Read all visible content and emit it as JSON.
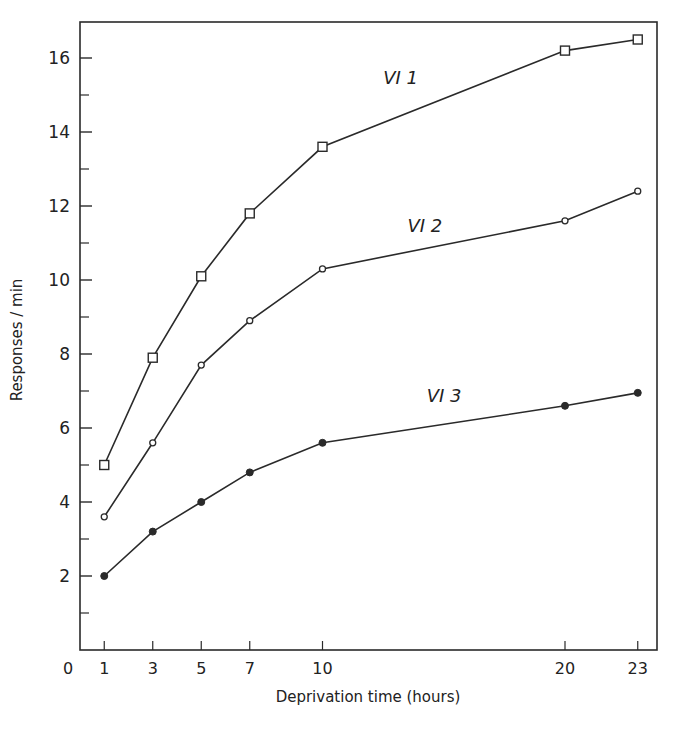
{
  "chart_data": {
    "type": "line",
    "title": "",
    "xlabel": "Deprivation time (hours)",
    "ylabel": "Responses / min",
    "x": [
      1,
      3,
      5,
      7,
      10,
      20,
      23
    ],
    "xticks": [
      0,
      1,
      3,
      5,
      7,
      10,
      20,
      23
    ],
    "yticks_labeled": [
      2,
      4,
      6,
      8,
      10,
      12,
      14,
      16
    ],
    "yticks_minor": [
      1,
      3,
      5,
      7,
      9,
      11,
      13,
      15
    ],
    "xlim": [
      0,
      24
    ],
    "ylim": [
      0,
      17
    ],
    "grid": false,
    "legend": "inline labels",
    "series": [
      {
        "name": "VI 1",
        "marker": "open-square",
        "values": [
          5.0,
          7.9,
          10.1,
          11.8,
          13.6,
          16.2,
          16.5
        ],
        "label_pos": [
          12.5,
          15.3
        ]
      },
      {
        "name": "VI 2",
        "marker": "open-circle",
        "values": [
          3.6,
          5.6,
          7.7,
          8.9,
          10.3,
          11.6,
          12.4
        ],
        "label_pos": [
          13.5,
          11.3
        ]
      },
      {
        "name": "VI 3",
        "marker": "filled-circle",
        "values": [
          2.0,
          3.2,
          4.0,
          4.8,
          5.6,
          6.6,
          6.95
        ],
        "label_pos": [
          14.3,
          6.7
        ]
      }
    ]
  },
  "labels": {
    "xaxis": "Deprivation time (hours)",
    "yaxis": "Responses / min"
  }
}
